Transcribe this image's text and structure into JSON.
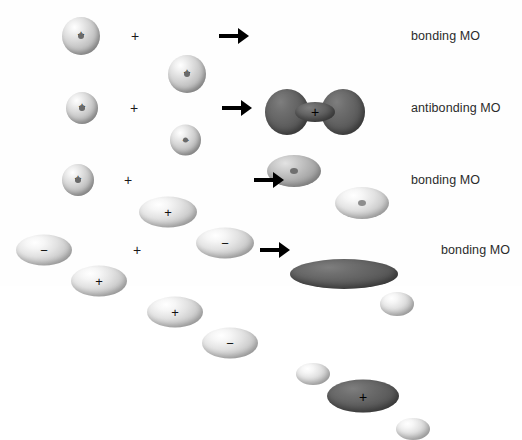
{
  "diagram": {
    "background_color": "#ffffff",
    "text_color": "#2b2b2b",
    "dark_orbital_color": "#5e5e5e",
    "light_orbital_color": "#d0d0d0",
    "operator_plus": "+",
    "arrow_icon": "right-arrow",
    "rows": [
      {
        "id": "row-1",
        "result_label": "bonding MO",
        "reactants": [
          {
            "type": "s-orbital",
            "shade": "light",
            "sign": "+"
          },
          {
            "type": "s-orbital",
            "shade": "light",
            "sign": "+"
          }
        ],
        "product": [
          {
            "type": "sigma-bonding-dumbbell",
            "shade": "dark",
            "sign": "+"
          }
        ]
      },
      {
        "id": "row-2",
        "result_label": "antibonding MO",
        "reactants": [
          {
            "type": "s-orbital",
            "shade": "light",
            "sign": "+"
          },
          {
            "type": "s-orbital",
            "shade": "light",
            "sign": "−"
          }
        ],
        "product": [
          {
            "type": "lobe",
            "shade": "mid",
            "sign": ""
          },
          {
            "type": "lobe",
            "shade": "light",
            "sign": ""
          }
        ]
      },
      {
        "id": "row-3",
        "result_label": "bonding MO",
        "reactants": [
          {
            "type": "s-orbital",
            "shade": "light",
            "sign": "+"
          },
          {
            "type": "p-orbital-lobe",
            "shade": "light",
            "sign": "+"
          },
          {
            "type": "p-orbital-lobe",
            "shade": "light",
            "sign": "−"
          }
        ],
        "product": [
          {
            "type": "large-lens",
            "shade": "dark",
            "sign": ""
          },
          {
            "type": "small-lobe",
            "shade": "light",
            "sign": ""
          }
        ]
      },
      {
        "id": "row-4",
        "result_label": "bonding MO",
        "reactants": [
          {
            "type": "p-orbital-lobe",
            "shade": "light",
            "sign": "−"
          },
          {
            "type": "p-orbital-lobe",
            "shade": "light",
            "sign": "+"
          },
          {
            "type": "p-orbital-lobe",
            "shade": "light",
            "sign": "+"
          },
          {
            "type": "p-orbital-lobe",
            "shade": "light",
            "sign": "−"
          }
        ],
        "product": [
          {
            "type": "small-lobe",
            "shade": "light",
            "sign": ""
          },
          {
            "type": "large-ellipse",
            "shade": "dark",
            "sign": "+"
          },
          {
            "type": "small-lobe",
            "shade": "light",
            "sign": ""
          }
        ]
      }
    ]
  }
}
